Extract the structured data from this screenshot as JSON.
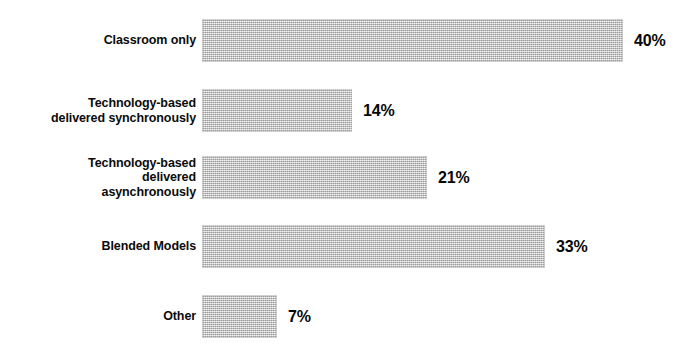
{
  "chart_data": {
    "type": "bar",
    "orientation": "horizontal",
    "title": "",
    "subtitle": "",
    "xlabel": "",
    "ylabel": "",
    "categories": [
      "Classroom only",
      "Technology-based\ndelivered synchronously",
      "Technology-based\ndelivered\nasynchronously",
      "Blended Models",
      "Other"
    ],
    "values": [
      40,
      14,
      21,
      33,
      7
    ],
    "value_labels": [
      "40%",
      "14%",
      "21%",
      "33%",
      "7%"
    ],
    "unit": "%",
    "xlim": [
      0,
      40
    ],
    "grid": false,
    "legend": null,
    "legend_position": "none",
    "annotations": [],
    "colors": {
      "bar_fill": "#c3c3c3",
      "bar_pattern": "dithered-halftone-gray",
      "text": "#0b0b0b",
      "background": "#ffffff"
    }
  },
  "chart": {
    "bars": [
      {
        "label": "Classroom only",
        "value": 40,
        "value_label": "40%",
        "bar_px": 421,
        "top_px": 19
      },
      {
        "label": "Technology-based\ndelivered synchronously",
        "value": 14,
        "value_label": "14%",
        "bar_px": 150,
        "top_px": 89
      },
      {
        "label": "Technology-based\ndelivered\nasynchronously",
        "value": 21,
        "value_label": "21%",
        "bar_px": 225,
        "top_px": 156
      },
      {
        "label": "Blended Models",
        "value": 33,
        "value_label": "33%",
        "bar_px": 343,
        "top_px": 225
      },
      {
        "label": "Other",
        "value": 7,
        "value_label": "7%",
        "bar_px": 75,
        "top_px": 295
      }
    ]
  }
}
